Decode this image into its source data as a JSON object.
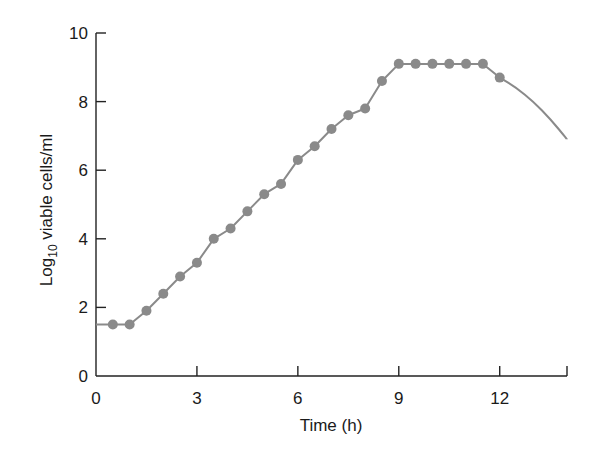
{
  "chart_data": {
    "type": "line",
    "title": "",
    "xlabel": "Time (h)",
    "ylabel_main": "Log",
    "ylabel_sub": "10",
    "ylabel_rest": " viable cells/ml",
    "ylabel": "Log10 viable cells/ml",
    "xlim": [
      0,
      14
    ],
    "ylim": [
      0,
      10
    ],
    "xticks": [
      0,
      3,
      6,
      9,
      12
    ],
    "yticks": [
      0,
      2,
      4,
      6,
      8,
      10
    ],
    "grid": false,
    "legend": null,
    "series": [
      {
        "name": "growth curve",
        "color": "#8a8a8a",
        "markers": true,
        "x": [
          0,
          0.5,
          1.0,
          1.5,
          2.0,
          2.5,
          3.0,
          3.5,
          4.0,
          4.5,
          5.0,
          5.5,
          6.0,
          6.5,
          7.0,
          7.5,
          8.0,
          8.5,
          9.0,
          9.5,
          10.0,
          10.5,
          11.0,
          11.5,
          12.0
        ],
        "values": [
          1.5,
          1.5,
          1.5,
          1.9,
          2.4,
          2.9,
          3.3,
          4.0,
          4.3,
          4.8,
          5.3,
          5.6,
          6.3,
          6.7,
          7.2,
          7.6,
          7.8,
          8.6,
          9.1,
          9.1,
          9.1,
          9.1,
          9.1,
          9.1,
          8.7
        ],
        "marker_indices_start": 1
      },
      {
        "name": "death phase (no markers)",
        "color": "#8a8a8a",
        "markers": false,
        "x": [
          12.0,
          12.5,
          13.0,
          13.5,
          14.0
        ],
        "values": [
          8.7,
          8.4,
          8.0,
          7.5,
          6.9
        ]
      }
    ]
  }
}
